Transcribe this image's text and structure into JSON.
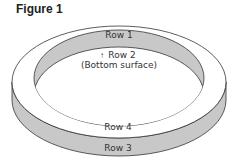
{
  "title": "Figure 1",
  "labels": {
    "row1": "Row 1",
    "row2": "Row 2",
    "row2_note": "(Bottom surface)",
    "row3": "Row 3",
    "row4": "Row 4"
  },
  "colors": {
    "shaded": "#c8c8c8",
    "face": "#ffffff",
    "stroke": "#333333"
  }
}
